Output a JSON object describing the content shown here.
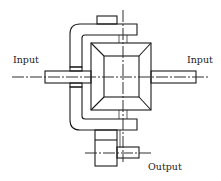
{
  "diagram": {
    "type": "mechanical-schematic",
    "labels": {
      "input_left": "Input",
      "input_right": "Input",
      "output": "Output"
    },
    "components": [
      {
        "name": "left-input-shaft",
        "role": "input"
      },
      {
        "name": "right-input-shaft",
        "role": "input"
      },
      {
        "name": "bevel-gear-box",
        "role": "differential"
      },
      {
        "name": "hatched-housing",
        "role": "carrier"
      },
      {
        "name": "output-gear",
        "role": "output"
      }
    ],
    "colors": {
      "line": "#1a1a1a",
      "background": "#ffffff"
    }
  }
}
